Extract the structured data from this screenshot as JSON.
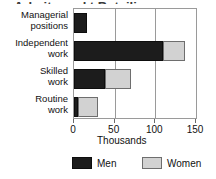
{
  "title_remnant": "Arbeitsmarkt Beteiligung",
  "chart_data": {
    "type": "bar",
    "orientation": "horizontal",
    "stacked": true,
    "title": "",
    "xlabel": "Thousands",
    "ylabel": "",
    "xlim": [
      0,
      150
    ],
    "xticks": [
      0,
      50,
      100,
      150
    ],
    "xtick_labels": [
      "0",
      "50",
      "100",
      "150"
    ],
    "grid": true,
    "legend_position": "bottom",
    "categories": [
      "Managerial positions",
      "Independent work",
      "Skilled work",
      "Routine work"
    ],
    "category_lines": [
      [
        "Managerial",
        "positions"
      ],
      [
        "Independent",
        "work"
      ],
      [
        "Skilled",
        "work"
      ],
      [
        "Routine",
        "work"
      ]
    ],
    "series": [
      {
        "name": "Men",
        "color": "#1c1c1c",
        "values": [
          16,
          110,
          38,
          5
        ]
      },
      {
        "name": "Women",
        "color": "#d2d2d2",
        "values": [
          1,
          27,
          32,
          24
        ]
      }
    ],
    "totals": [
      17,
      137,
      70,
      29
    ]
  },
  "legend": {
    "items": [
      {
        "label": "Men",
        "color": "#1c1c1c"
      },
      {
        "label": "Women",
        "color": "#d2d2d2"
      }
    ]
  },
  "axis": {
    "x_title": "Thousands",
    "tick_labels": [
      "0",
      "50",
      "100",
      "150"
    ]
  },
  "colors": {
    "men": "#1c1c1c",
    "women": "#d2d2d2",
    "frame": "#9a9a9a",
    "text": "#111111",
    "background": "#ffffff"
  }
}
